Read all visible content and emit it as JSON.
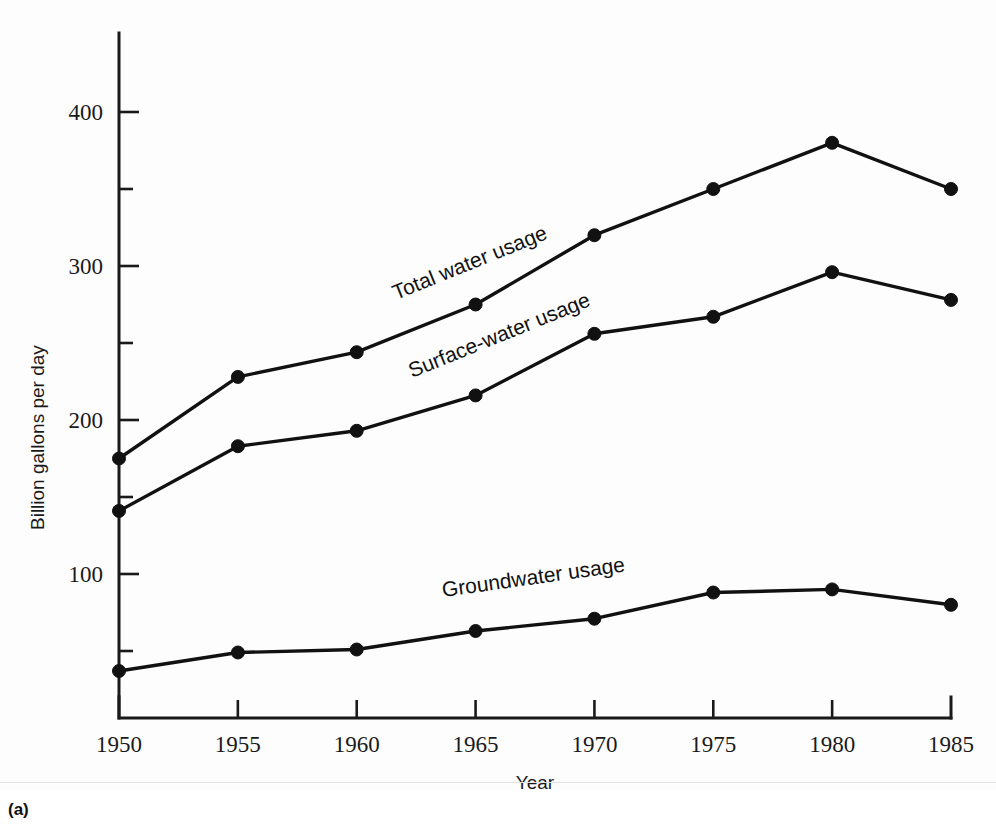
{
  "figure": {
    "caption": "(a)"
  },
  "chart_data": {
    "type": "line",
    "title": "",
    "xlabel": "Year",
    "ylabel": "Billion gallons per day",
    "x": [
      1950,
      1955,
      1960,
      1965,
      1970,
      1975,
      1980,
      1985
    ],
    "categories": [
      "1950",
      "1955",
      "1960",
      "1965",
      "1970",
      "1975",
      "1980",
      "1985"
    ],
    "xlim": [
      1950,
      1985
    ],
    "ylim": [
      6,
      430
    ],
    "grid": false,
    "legend_position": "inline-annotations",
    "y_major_ticks": [
      100,
      200,
      300,
      400
    ],
    "y_minor_ticks": [
      50,
      150,
      250,
      350
    ],
    "y_tick_labels": [
      "100",
      "200",
      "300",
      "400"
    ],
    "series": [
      {
        "name": "Total water usage",
        "label": "Total water usage",
        "color": "#111111",
        "values": [
          175,
          228,
          244,
          275,
          320,
          350,
          380,
          350
        ]
      },
      {
        "name": "Surface-water usage",
        "label": "Surface-water usage",
        "color": "#111111",
        "values": [
          141,
          183,
          193,
          216,
          256,
          267,
          296,
          278
        ]
      },
      {
        "name": "Groundwater usage",
        "label": "Groundwater usage",
        "color": "#111111",
        "values": [
          37,
          49,
          51,
          63,
          71,
          88,
          90,
          80
        ]
      }
    ],
    "annotations": [
      {
        "text": "Total water usage",
        "x_px": 396,
        "y_px": 300,
        "rotation": -22
      },
      {
        "text": "Surface-water usage",
        "x_px": 412,
        "y_px": 378,
        "rotation": -22
      },
      {
        "text": "Groundwater usage",
        "x_px": 443,
        "y_px": 597,
        "rotation": -8
      }
    ]
  }
}
